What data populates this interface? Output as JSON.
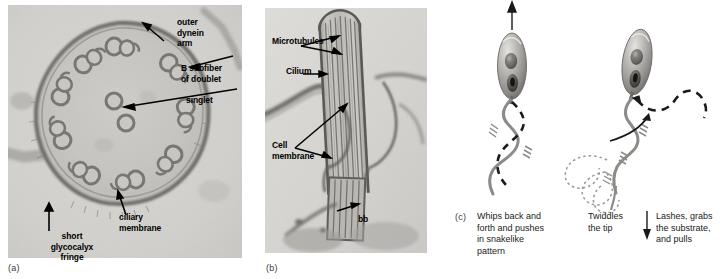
{
  "figure": {
    "type": "scientific-figure",
    "background": "#ffffff"
  },
  "panels": [
    {
      "id": "a",
      "letter": "(a)",
      "kind": "electron-micrograph",
      "subject": "cross section of a cilium axoneme (9+2 arrangement)",
      "labels": [
        {
          "name": "outer-dynein-arm",
          "text": "outer\ndynein\narm"
        },
        {
          "name": "b-subfiber-of-doublet",
          "text": "B subfiber\nof doublet"
        },
        {
          "name": "singlet",
          "text": "singlet"
        },
        {
          "name": "ciliary-membrane",
          "text": "ciliary\nmembrane"
        },
        {
          "name": "short-glycocalyx-fringe",
          "text": "short\nglycocalyx\nfringe"
        }
      ]
    },
    {
      "id": "b",
      "letter": "(b)",
      "kind": "electron-micrograph",
      "subject": "longitudinal section of a cilium with basal body",
      "labels": [
        {
          "name": "microtubules",
          "text": "Microtubules"
        },
        {
          "name": "cilium",
          "text": "Cilium"
        },
        {
          "name": "cell-membrane",
          "text": "Cell\nmembrane"
        },
        {
          "name": "basal-body",
          "text": "bb"
        }
      ]
    },
    {
      "id": "c",
      "letter": "(c)",
      "kind": "line-diagram",
      "subject": "two sperm cells showing flagellar movement patterns",
      "captions": [
        {
          "name": "caption-whips",
          "text": "Whips back and\nforth and pushes\nin snakelike\npattern"
        },
        {
          "name": "caption-twiddles",
          "text": "Twiddles\nthe tip"
        },
        {
          "name": "caption-lashes",
          "text": "Lashes, grabs\nthe substrate,\nand pulls"
        }
      ],
      "motion_arrows": [
        {
          "name": "swim-direction-arrow",
          "direction": "up"
        },
        {
          "name": "tip-twiddle-arrow",
          "direction": "down"
        },
        {
          "name": "lash-curve-arrow",
          "direction": "curved-up-right"
        }
      ]
    }
  ],
  "colors": {
    "micrograph_light": "#d8d6d2",
    "micrograph_mid": "#b4b2ae",
    "micrograph_dark": "#6d6a66",
    "ink": "#000000",
    "diagram_gray": "#8d8d8d",
    "caption_gray": "#222222"
  }
}
